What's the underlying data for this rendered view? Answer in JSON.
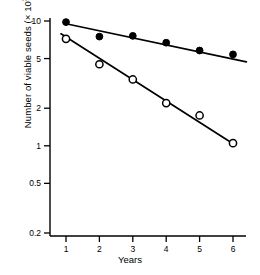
{
  "chart_data": {
    "type": "scatter",
    "title": "",
    "xlabel": "Years",
    "ylabel_text": "Number of viable seeds (× 10",
    "ylabel_exponent": "3",
    "ylabel_tail": ")",
    "x": [
      1,
      2,
      3,
      4,
      5,
      6
    ],
    "xlim": [
      0.62,
      6.45
    ],
    "ylim": [
      0.2,
      10
    ],
    "yscale": "log",
    "xticks": [
      "1",
      "2",
      "3",
      "4",
      "5",
      "6"
    ],
    "yticks": [
      "10",
      "5",
      "2",
      "1",
      "0.5",
      "0.2"
    ],
    "ytick_values": [
      10,
      5,
      2,
      1,
      0.5,
      0.2
    ],
    "grid": false,
    "legend": "none",
    "series": [
      {
        "name": "filled-circles",
        "marker": "filled-circle",
        "color": "#000000",
        "values": [
          9.8,
          7.5,
          7.6,
          6.7,
          5.8,
          5.4
        ],
        "fit_line": {
          "x0": 1,
          "y0": 9.5,
          "x1": 6.4,
          "y1": 4.7
        }
      },
      {
        "name": "open-circles",
        "marker": "open-circle",
        "color": "#000000",
        "values": [
          7.2,
          4.5,
          3.4,
          2.2,
          1.75,
          1.05
        ],
        "fit_line": {
          "x0": 0.85,
          "y0": 7.9,
          "x1": 6.05,
          "y1": 1.02
        }
      }
    ]
  },
  "axes": {
    "line_color": "#000000",
    "axis_left_x": 1,
    "axis_bottom_y": 1
  }
}
